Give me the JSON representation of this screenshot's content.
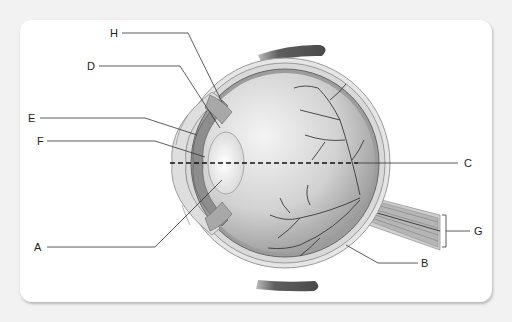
{
  "diagram": {
    "type": "anatomical cross-section",
    "labels": [
      {
        "id": "A",
        "text": "A",
        "x": 34,
        "y": 242
      },
      {
        "id": "B",
        "text": "B",
        "x": 421,
        "y": 258
      },
      {
        "id": "C",
        "text": "C",
        "x": 464,
        "y": 158
      },
      {
        "id": "D",
        "text": "D",
        "x": 87,
        "y": 61
      },
      {
        "id": "E",
        "text": "E",
        "x": 28,
        "y": 113
      },
      {
        "id": "F",
        "text": "F",
        "x": 37,
        "y": 136
      },
      {
        "id": "G",
        "text": "G",
        "x": 474,
        "y": 226
      },
      {
        "id": "H",
        "text": "H",
        "x": 110,
        "y": 28
      }
    ],
    "colors": {
      "background": "#f2f2f2",
      "card": "#ffffff",
      "leader_line": "#333333",
      "muscle": "#6b6b6b",
      "vessel": "#3a3a3a",
      "sclera": "#e4e4e4",
      "vitreous_light": "#f0f0f0",
      "vitreous_dark": "#9a9a9a"
    }
  }
}
